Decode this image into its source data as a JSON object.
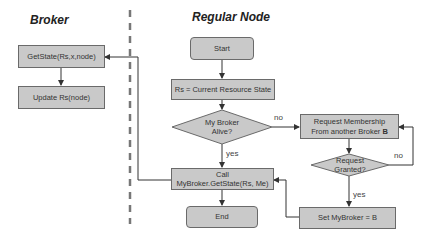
{
  "lanes": {
    "broker_title": "Broker",
    "regular_title": "Regular Node"
  },
  "broker": {
    "getstate": "GetState(Rs,x,node)",
    "update": "Update Rs(node)"
  },
  "regular": {
    "start": "Start",
    "rs": "Rs = Current Resource State",
    "alive_l1": "My Broker",
    "alive_l2": "Alive?",
    "call_l1": "Call",
    "call_l2": "MyBroker.GetState(Rs, Me)",
    "end": "End",
    "request_l1": "Request Membership",
    "request_l2": "From another Broker ",
    "request_b": "B",
    "granted_l1": "Request",
    "granted_l2": "Granted?",
    "set": "Set MyBroker = B"
  },
  "edges": {
    "no1": "no",
    "yes1": "yes",
    "no2": "no",
    "yes2": "yes"
  },
  "colors": {
    "box_fill": "#c9c9c9",
    "box_border": "#6a6a6a",
    "line": "#333333",
    "divider": "#777777"
  }
}
